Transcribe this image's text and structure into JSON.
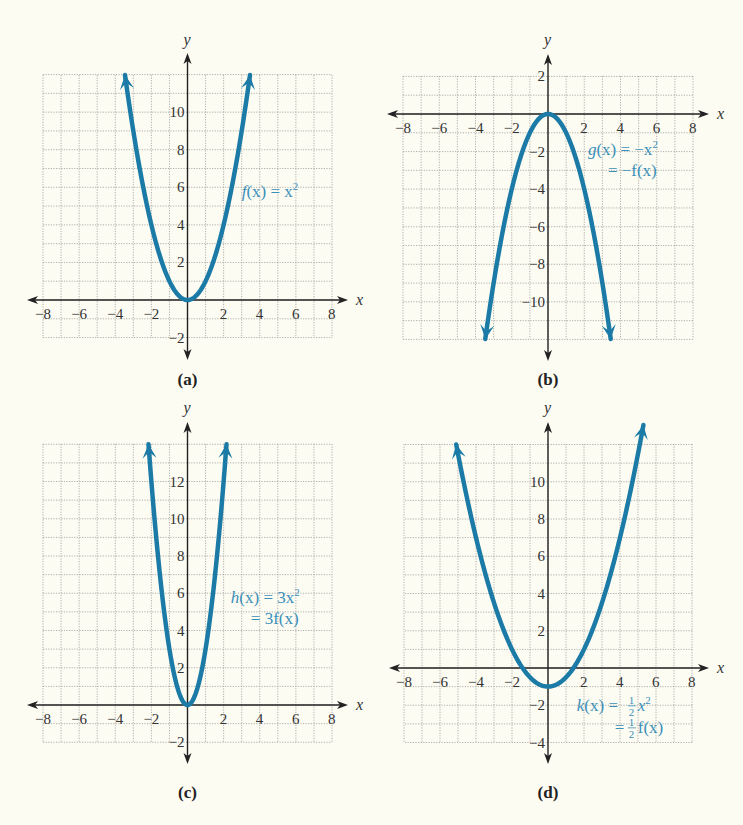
{
  "chart_data": [
    {
      "type": "line",
      "panel_label": "(a)",
      "title": "",
      "xlabel": "x",
      "ylabel": "y",
      "xlim": [
        -8,
        8
      ],
      "ylim": [
        -2,
        12
      ],
      "grid": true,
      "x_ticks": [
        -8,
        -6,
        -4,
        -2,
        2,
        4,
        6,
        8
      ],
      "y_ticks": [
        2,
        4,
        6,
        8,
        10,
        -2
      ],
      "series": [
        {
          "name": "f(x) = x^2",
          "function": "x^2",
          "x_range": [
            -3.46,
            3.46
          ],
          "points": [
            [
              -3.46,
              12
            ],
            [
              -3,
              9
            ],
            [
              -2,
              4
            ],
            [
              -1,
              1
            ],
            [
              0,
              0
            ],
            [
              1,
              1
            ],
            [
              2,
              4
            ],
            [
              3,
              9
            ],
            [
              3.46,
              12
            ]
          ]
        }
      ],
      "annotations": [
        {
          "lines": [
            "f(x) = x²"
          ],
          "position": [
            3,
            5.5
          ]
        }
      ],
      "layout": {
        "left": 43,
        "right": 332,
        "top": 75,
        "bottom": 338,
        "y_top": 12,
        "y_bottom": -2,
        "x_axis_px": 300,
        "y_axis_px": 187.5,
        "label_y": 385,
        "ylabel_y": 45
      }
    },
    {
      "type": "line",
      "panel_label": "(b)",
      "title": "",
      "xlabel": "x",
      "ylabel": "y",
      "xlim": [
        -8,
        8
      ],
      "ylim": [
        -12,
        2
      ],
      "grid": true,
      "x_ticks": [
        -8,
        -6,
        -4,
        -2,
        2,
        4,
        6,
        8
      ],
      "y_ticks": [
        2,
        -2,
        -4,
        -6,
        -8,
        -10
      ],
      "series": [
        {
          "name": "g(x) = -x^2 = -f(x)",
          "function": "-x^2",
          "x_range": [
            -3.46,
            3.46
          ],
          "points": [
            [
              -3.46,
              -12
            ],
            [
              -3,
              -9
            ],
            [
              -2,
              -4
            ],
            [
              -1,
              -1
            ],
            [
              0,
              0
            ],
            [
              1,
              -1
            ],
            [
              2,
              -4
            ],
            [
              3,
              -9
            ],
            [
              3.46,
              -12
            ]
          ]
        }
      ],
      "annotations": [
        {
          "lines": [
            "g(x) = −x²",
            "= −f(x)"
          ],
          "position": [
            2.2,
            -2.2
          ]
        }
      ],
      "layout": {
        "left": 403,
        "right": 693,
        "top": 76,
        "bottom": 339,
        "y_top": 2,
        "y_bottom": -12,
        "x_axis_px": 114,
        "y_axis_px": 548,
        "label_y": 385,
        "ylabel_y": 45
      }
    },
    {
      "type": "line",
      "panel_label": "(c)",
      "title": "",
      "xlabel": "x",
      "ylabel": "y",
      "xlim": [
        -8,
        8
      ],
      "ylim": [
        -2,
        14
      ],
      "grid": true,
      "x_ticks": [
        -8,
        -6,
        -4,
        -2,
        2,
        4,
        6,
        8
      ],
      "y_ticks": [
        2,
        4,
        6,
        8,
        10,
        12,
        -2
      ],
      "series": [
        {
          "name": "h(x) = 3x^2 = 3f(x)",
          "function": "3*x^2",
          "x_range": [
            -2.16,
            2.16
          ],
          "points": [
            [
              -2.16,
              14
            ],
            [
              -2,
              12
            ],
            [
              -1.5,
              6.75
            ],
            [
              -1,
              3
            ],
            [
              0,
              0
            ],
            [
              1,
              3
            ],
            [
              1.5,
              6.75
            ],
            [
              2,
              12
            ],
            [
              2.16,
              14
            ]
          ]
        }
      ],
      "annotations": [
        {
          "lines": [
            "h(x) = 3x²",
            "= 3f(x)"
          ],
          "position": [
            2.4,
            5.5
          ]
        }
      ],
      "layout": {
        "left": 43,
        "right": 332,
        "top": 444,
        "bottom": 742,
        "y_top": 14,
        "y_bottom": -2,
        "x_axis_px": 705,
        "y_axis_px": 187.5,
        "label_y": 798,
        "ylabel_y": 413
      }
    },
    {
      "type": "line",
      "panel_label": "(d)",
      "title": "",
      "xlabel": "x",
      "ylabel": "y",
      "xlim": [
        -8,
        8
      ],
      "ylim": [
        -4,
        12
      ],
      "grid": true,
      "x_ticks": [
        -8,
        -6,
        -4,
        -2,
        2,
        4,
        6,
        8
      ],
      "y_ticks": [
        2,
        4,
        6,
        8,
        10,
        -2,
        -4
      ],
      "series": [
        {
          "name": "k(x) = (1/2)x^2 = (1/2)f(x)",
          "function": "0.5*x^2 - 1",
          "x_range": [
            -5.1,
            5.3
          ],
          "points": [
            [
              -5.1,
              12
            ],
            [
              -4,
              7
            ],
            [
              -2,
              1
            ],
            [
              -1.41,
              0
            ],
            [
              0,
              -1
            ],
            [
              1.41,
              0
            ],
            [
              2,
              1
            ],
            [
              4,
              7
            ],
            [
              5.3,
              13
            ]
          ]
        }
      ],
      "annotations": [
        {
          "lines": [
            "k(x) = ½x²",
            "= ½f(x)"
          ],
          "position": [
            1.6,
            -2.3
          ]
        }
      ],
      "layout": {
        "left": 405,
        "right": 693,
        "top": 444,
        "bottom": 742,
        "y_top": 12,
        "y_bottom": -4,
        "x_axis_px": 668,
        "y_axis_px": 548,
        "label_y": 798,
        "ylabel_y": 413
      }
    }
  ],
  "figure": {
    "panel_labels": [
      "(a)",
      "(b)",
      "(c)",
      "(d)"
    ],
    "equations": {
      "a": {
        "line1_fn": "f",
        "line1_rest": "(x) = x",
        "line1_sup": "2"
      },
      "b": {
        "line1_fn": "g",
        "line1_rest": "(x) = −x",
        "line1_sup": "2",
        "line2": "= −f(x)"
      },
      "c": {
        "line1_fn": "h",
        "line1_rest": "(x) = 3x",
        "line1_sup": "2",
        "line2": "= 3f(x)"
      },
      "d": {
        "line1_fn": "k",
        "line1_rest": "(x) = ",
        "frac_num": "1",
        "frac_den": "2",
        "line1_tail": "x",
        "line1_sup": "2",
        "line2_eq": "= ",
        "line2_tail": "f(x)"
      }
    },
    "colors": {
      "background": "#fdfcf3",
      "curve": "#1b7ba6",
      "equation_text": "#3a8fb8",
      "axis": "#222222",
      "grid": "#9a9a9a"
    }
  }
}
